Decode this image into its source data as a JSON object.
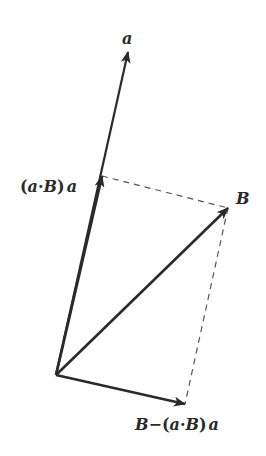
{
  "diagram": {
    "colors": {
      "stroke": "#2a2a2a",
      "dashed": "#555555",
      "background": "#ffffff"
    },
    "points": {
      "origin": [
        56,
        375
      ],
      "a_tip": [
        128,
        52
      ],
      "proj_tip": [
        102,
        176
      ],
      "B_tip": [
        228,
        208
      ],
      "perp_tip": [
        185,
        404
      ]
    },
    "vectors": [
      {
        "id": "a",
        "from": "origin",
        "to": "a_tip",
        "label": "a"
      },
      {
        "id": "proj",
        "from": "origin",
        "to": "proj_tip",
        "label": "(a·B) a"
      },
      {
        "id": "B",
        "from": "origin",
        "to": "B_tip",
        "label": "B"
      },
      {
        "id": "perp",
        "from": "origin",
        "to": "perp_tip",
        "label": "B−(a·B) a"
      }
    ],
    "dashed_lines": [
      {
        "from": "proj_tip",
        "to": "B_tip"
      },
      {
        "from": "B_tip",
        "to": "perp_tip"
      }
    ],
    "labels": {
      "a": "a",
      "proj_open": "(",
      "proj_a1": "a",
      "proj_dot": "·",
      "proj_B": "B",
      "proj_close": ")",
      "proj_a2": "a",
      "B": "B",
      "perp_B": "B",
      "perp_minus": "−",
      "perp_open": "(",
      "perp_a1": "a",
      "perp_dot": "·",
      "perp_B2": "B",
      "perp_close": ")",
      "perp_a2": "a"
    }
  }
}
